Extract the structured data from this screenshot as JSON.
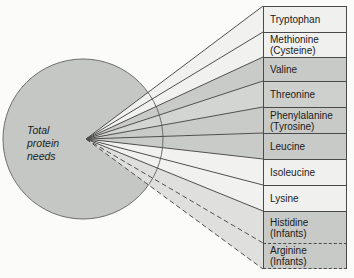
{
  "diagram": {
    "circle": {
      "label": "Total\nprotein\nneeds"
    },
    "boxes": [
      {
        "label": "Tryptophan",
        "shade": "light",
        "border": "solid"
      },
      {
        "label": "Methionine\n(Cysteine)",
        "shade": "light",
        "border": "solid"
      },
      {
        "label": "Valine",
        "shade": "gray",
        "border": "solid"
      },
      {
        "label": "Threonine",
        "shade": "gray-mid",
        "border": "solid"
      },
      {
        "label": "Phenylalanine\n(Tyrosine)",
        "shade": "gray",
        "border": "solid"
      },
      {
        "label": "Leucine",
        "shade": "gray",
        "border": "solid"
      },
      {
        "label": "Isoleucine",
        "shade": "light",
        "border": "solid"
      },
      {
        "label": "Lysine",
        "shade": "light",
        "border": "solid"
      },
      {
        "label": "Histidine\n(Infants)",
        "shade": "gray",
        "border": "solid-top-dashed-bottom"
      },
      {
        "label": "Arginine\n(Infants)",
        "shade": "gray",
        "border": "dashed"
      }
    ],
    "palette": {
      "background": "#fbfbf9",
      "circle_fill": "#c5c7c4",
      "box_light": "#f0f0ee",
      "box_gray": "#c8cac7",
      "wedge_light_gray": "#dfe0dd",
      "line_color": "#4f4f4f"
    }
  }
}
